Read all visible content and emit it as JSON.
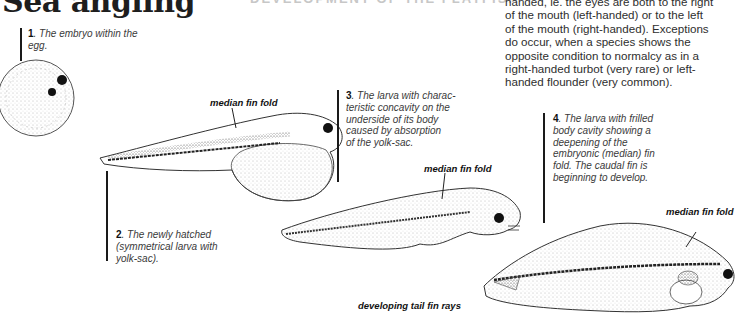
{
  "page": {
    "title": "Sea angling",
    "section_heading": "DEVELOPMENT OF THE FLATFISH"
  },
  "body_text": {
    "lines": [
      "handed, ie. the eyes are both to the right",
      "of the mouth (left-handed) or to the left",
      "of the mouth (right-handed). Exceptions",
      "do occur, when a species shows the",
      "opposite condition to normalcy as in a",
      "right-handed turbot (very rare) or left-",
      "handed flounder (very common)."
    ]
  },
  "stages": [
    {
      "number": "1",
      "caption_line1": ". The embryo within the",
      "caption_line2": "egg."
    },
    {
      "number": "2",
      "caption_line1": ". The newly hatched",
      "caption_line2": "(symmetrical larva with",
      "caption_line3": "yolk-sac)."
    },
    {
      "number": "3",
      "caption_line1": ". The larva with charac-",
      "caption_line2": "teristic concavity on the",
      "caption_line3": "underside of its body",
      "caption_line4": "caused by absorption",
      "caption_line5": "of the yolk-sac."
    },
    {
      "number": "4",
      "caption_line1": ". The larva with frilled",
      "caption_line2": "body cavity showing a",
      "caption_line3": "deepening of the",
      "caption_line4": "embryonic (median) fin",
      "caption_line5": "fold. The caudal fin is",
      "caption_line6": "beginning to develop."
    }
  ],
  "labels": {
    "median_fin_fold_2": "median fin fold",
    "median_fin_fold_3": "median fin fold",
    "median_fin_fold_4": "median fin fold",
    "developing_tail_fin_rays": "developing tail fin rays"
  }
}
